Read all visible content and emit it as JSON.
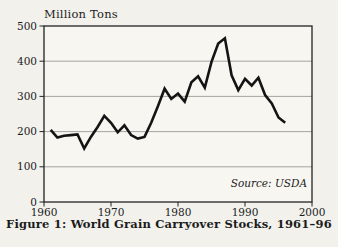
{
  "figure": {
    "unit_label": "Million Tons",
    "source": "Source: USDA",
    "caption": "Figure 1: World Grain Carryover Stocks, 1961–96"
  },
  "colors": {
    "page_bg": "#f2f1ec",
    "plot_bg": "#f7f6f1",
    "line": "#141414",
    "grid": "#9c9b96",
    "axis": "#232323",
    "text": "#1c1c1c"
  },
  "chart_data": {
    "type": "line",
    "title": "Figure 1: World Grain Carryover Stocks, 1961–96",
    "ylabel": "Million Tons",
    "xlabel": "",
    "source": "Source: USDA",
    "xlim": [
      1960,
      2000
    ],
    "ylim": [
      0,
      500
    ],
    "x_ticks": [
      1960,
      1970,
      1980,
      1990,
      2000
    ],
    "y_ticks": [
      0,
      100,
      200,
      300,
      400,
      500
    ],
    "grid": true,
    "legend": "none",
    "series": [
      {
        "name": "World grain carryover stocks (million tons)",
        "x": [
          1961,
          1962,
          1963,
          1964,
          1965,
          1966,
          1967,
          1968,
          1969,
          1970,
          1971,
          1972,
          1973,
          1974,
          1975,
          1976,
          1977,
          1978,
          1979,
          1980,
          1981,
          1982,
          1983,
          1984,
          1985,
          1986,
          1987,
          1988,
          1989,
          1990,
          1991,
          1992,
          1993,
          1994,
          1995,
          1996
        ],
        "values": [
          205,
          183,
          188,
          190,
          192,
          152,
          185,
          213,
          245,
          225,
          198,
          218,
          190,
          180,
          185,
          225,
          272,
          322,
          293,
          308,
          285,
          340,
          357,
          325,
          398,
          450,
          465,
          360,
          318,
          350,
          331,
          353,
          304,
          280,
          240,
          225
        ]
      }
    ]
  }
}
